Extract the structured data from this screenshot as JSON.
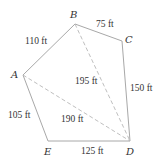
{
  "diagram": {
    "type": "polygon-survey",
    "vertices": [
      {
        "id": "A",
        "label": "A",
        "x": 23,
        "y": 75,
        "lx": 11,
        "ly": 78
      },
      {
        "id": "B",
        "label": "B",
        "x": 75,
        "y": 24,
        "lx": 70,
        "ly": 18
      },
      {
        "id": "C",
        "label": "C",
        "x": 122,
        "y": 41,
        "lx": 125,
        "ly": 43
      },
      {
        "id": "D",
        "label": "D",
        "x": 130,
        "y": 141,
        "lx": 126,
        "ly": 155
      },
      {
        "id": "E",
        "label": "E",
        "x": 48,
        "y": 141,
        "lx": 44,
        "ly": 155
      }
    ],
    "sides": [
      {
        "from": "A",
        "to": "B",
        "label": "110 ft",
        "lx": 25,
        "ly": 44
      },
      {
        "from": "B",
        "to": "C",
        "label": "75 ft",
        "lx": 96,
        "ly": 27
      },
      {
        "from": "C",
        "to": "D",
        "label": "150 ft",
        "lx": 130,
        "ly": 91
      },
      {
        "from": "D",
        "to": "E",
        "label": "125 ft",
        "lx": 81,
        "ly": 154
      },
      {
        "from": "E",
        "to": "A",
        "label": "105 ft",
        "lx": 8,
        "ly": 118
      }
    ],
    "diagonals": [
      {
        "from": "B",
        "to": "D",
        "label": "195 ft",
        "lx": 75,
        "ly": 84
      },
      {
        "from": "A",
        "to": "D",
        "label": "190 ft",
        "lx": 61,
        "ly": 122
      }
    ],
    "colors": {
      "edge": "#a8a8a8",
      "diagonal": "#b8b8b8",
      "text": "#333333"
    }
  }
}
